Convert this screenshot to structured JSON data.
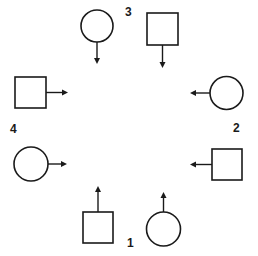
{
  "diagram": {
    "colors": {
      "stroke": "#1a1a1a",
      "background": "#ffffff"
    },
    "labels": [
      {
        "id": "1",
        "text": "1",
        "x": 130,
        "y": 247
      },
      {
        "id": "2",
        "text": "2",
        "x": 237,
        "y": 132
      },
      {
        "id": "3",
        "text": "3",
        "x": 128,
        "y": 16
      },
      {
        "id": "4",
        "text": "4",
        "x": 14,
        "y": 133
      }
    ],
    "shapes": [
      {
        "name": "top-circle",
        "type": "circle",
        "cx": 97,
        "cy": 26,
        "r": 16,
        "arrow": "down",
        "group": "3"
      },
      {
        "name": "top-square",
        "type": "square",
        "x": 147,
        "y": 13,
        "size": 31,
        "arrow": "down",
        "group": "3"
      },
      {
        "name": "right-circle",
        "type": "circle",
        "cx": 226,
        "cy": 93,
        "r": 16,
        "arrow": "left",
        "group": "2"
      },
      {
        "name": "right-square",
        "type": "square",
        "x": 212,
        "y": 149,
        "size": 31,
        "arrow": "left",
        "group": "2"
      },
      {
        "name": "bottom-circle",
        "type": "circle",
        "cx": 163,
        "cy": 229,
        "r": 17,
        "arrow": "up",
        "group": "1"
      },
      {
        "name": "bottom-square",
        "type": "square",
        "x": 83,
        "y": 212,
        "size": 31,
        "arrow": "up",
        "group": "1"
      },
      {
        "name": "left-circle",
        "type": "circle",
        "cx": 31,
        "cy": 164,
        "r": 17,
        "arrow": "right",
        "group": "4"
      },
      {
        "name": "left-square",
        "type": "square",
        "x": 15,
        "y": 77,
        "size": 31,
        "arrow": "right",
        "group": "4"
      }
    ]
  }
}
